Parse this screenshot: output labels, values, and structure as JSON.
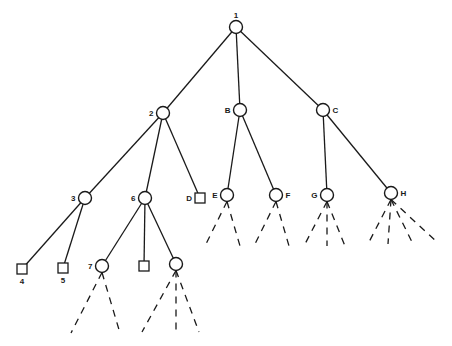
{
  "diagram": {
    "type": "game-tree",
    "nodes": [
      {
        "id": "n1",
        "label": "1",
        "shape": "circle",
        "label_pos": "top"
      },
      {
        "id": "n2",
        "label": "2",
        "shape": "circle",
        "label_pos": "left"
      },
      {
        "id": "nB",
        "label": "B",
        "shape": "circle",
        "label_pos": "left"
      },
      {
        "id": "nC",
        "label": "C",
        "shape": "circle",
        "label_pos": "right"
      },
      {
        "id": "n3",
        "label": "3",
        "shape": "circle",
        "label_pos": "left"
      },
      {
        "id": "n6",
        "label": "6",
        "shape": "circle",
        "label_pos": "left"
      },
      {
        "id": "nD",
        "label": "D",
        "shape": "square",
        "label_pos": "left"
      },
      {
        "id": "nE",
        "label": "E",
        "shape": "circle",
        "label_pos": "left"
      },
      {
        "id": "nF",
        "label": "F",
        "shape": "circle",
        "label_pos": "right"
      },
      {
        "id": "nG",
        "label": "G",
        "shape": "circle",
        "label_pos": "left"
      },
      {
        "id": "nH",
        "label": "H",
        "shape": "circle",
        "label_pos": "right"
      },
      {
        "id": "n4",
        "label": "4",
        "shape": "square",
        "label_pos": "bottom"
      },
      {
        "id": "n5",
        "label": "5",
        "shape": "square",
        "label_pos": "bottom"
      },
      {
        "id": "n7",
        "label": "7",
        "shape": "circle",
        "label_pos": "left"
      },
      {
        "id": "n6b",
        "label": "",
        "shape": "square",
        "label_pos": "none"
      },
      {
        "id": "n6c",
        "label": "",
        "shape": "circle",
        "label_pos": "none"
      }
    ],
    "edges": [
      {
        "from": "n1",
        "to": "n2"
      },
      {
        "from": "n1",
        "to": "nB"
      },
      {
        "from": "n1",
        "to": "nC"
      },
      {
        "from": "n2",
        "to": "n3"
      },
      {
        "from": "n2",
        "to": "n6"
      },
      {
        "from": "n2",
        "to": "nD"
      },
      {
        "from": "nB",
        "to": "nE"
      },
      {
        "from": "nB",
        "to": "nF"
      },
      {
        "from": "nC",
        "to": "nG"
      },
      {
        "from": "nC",
        "to": "nH"
      },
      {
        "from": "n3",
        "to": "n4"
      },
      {
        "from": "n3",
        "to": "n5"
      },
      {
        "from": "n6",
        "to": "n7"
      },
      {
        "from": "n6",
        "to": "n6b"
      },
      {
        "from": "n6",
        "to": "n6c"
      }
    ],
    "unexpanded_branches": [
      {
        "node": "nE",
        "count": 2
      },
      {
        "node": "nF",
        "count": 2
      },
      {
        "node": "nG",
        "count": 3
      },
      {
        "node": "nH",
        "count": 4
      },
      {
        "node": "n7",
        "count": 2
      },
      {
        "node": "n6c",
        "count": 3
      }
    ]
  }
}
